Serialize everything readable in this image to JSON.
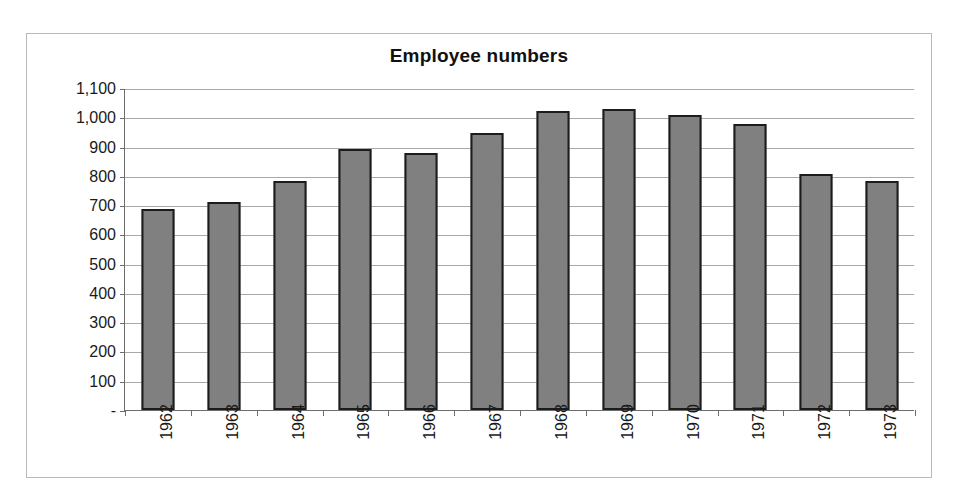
{
  "chart_data": {
    "type": "bar",
    "title": "Employee numbers",
    "xlabel": "",
    "ylabel": "",
    "categories": [
      "1962",
      "1963",
      "1964",
      "1965",
      "1966",
      "1967",
      "1968",
      "1969",
      "1970",
      "1971",
      "1972",
      "1973"
    ],
    "values": [
      685,
      712,
      782,
      893,
      878,
      945,
      1022,
      1030,
      1008,
      977,
      807,
      783
    ],
    "ylim": [
      0,
      1100
    ],
    "ytick_values": [
      1100,
      1000,
      900,
      800,
      700,
      600,
      500,
      400,
      300,
      200,
      100,
      0
    ],
    "ytick_labels": [
      "1,100",
      "1,000",
      "900",
      "800",
      "700",
      "600",
      "500",
      "400",
      "300",
      "200",
      "100",
      "-"
    ],
    "grid": true,
    "legend": false,
    "legend_position": "none",
    "bar_color": "#808080",
    "bar_border_color": "#1c1c1c",
    "gridline_color": "#a8a8a8",
    "axis_color": "#6d6d6d",
    "frame_color": "#b9b9b9",
    "background_color": "#ffffff",
    "xlabel_rotation": 90
  }
}
